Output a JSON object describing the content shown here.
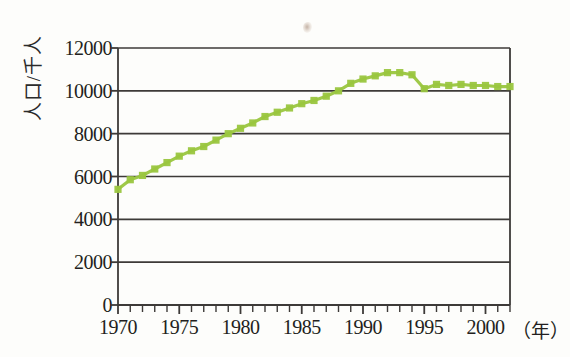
{
  "chart_data": {
    "type": "line",
    "title": "",
    "subtitle": "",
    "xlabel": "年",
    "ylabel": "人口/千人",
    "xlim": [
      1970,
      2002
    ],
    "ylim": [
      0,
      12000
    ],
    "grid": true,
    "legend": null,
    "marker": "square",
    "series_color": "#9ac63f",
    "axis_color": "#3d3a38",
    "x_tick_labels": [
      "1970",
      "1975",
      "1980",
      "1985",
      "1990",
      "1995",
      "2000"
    ],
    "x_tick_values": [
      1970,
      1975,
      1980,
      1985,
      1990,
      1995,
      2000
    ],
    "x_minor_tick_step": 1,
    "y_tick_labels": [
      "0",
      "2000",
      "4000",
      "6000",
      "8000",
      "10000",
      "12000"
    ],
    "y_tick_values": [
      0,
      2000,
      4000,
      6000,
      8000,
      10000,
      12000
    ],
    "series": [
      {
        "name": "人口",
        "x": [
          1970,
          1971,
          1972,
          1973,
          1974,
          1975,
          1976,
          1977,
          1978,
          1979,
          1980,
          1981,
          1982,
          1983,
          1984,
          1985,
          1986,
          1987,
          1988,
          1989,
          1990,
          1991,
          1992,
          1993,
          1994,
          1995,
          1996,
          1997,
          1998,
          1999,
          2000,
          2001,
          2002
        ],
        "values": [
          5400,
          5850,
          6050,
          6350,
          6650,
          6950,
          7200,
          7400,
          7700,
          8000,
          8250,
          8500,
          8800,
          9000,
          9200,
          9400,
          9550,
          9750,
          10000,
          10350,
          10550,
          10700,
          10850,
          10850,
          10750,
          10100,
          10300,
          10250,
          10300,
          10250,
          10250,
          10200,
          10200
        ]
      }
    ]
  },
  "axis": {
    "unit_suffix": "（年）"
  }
}
